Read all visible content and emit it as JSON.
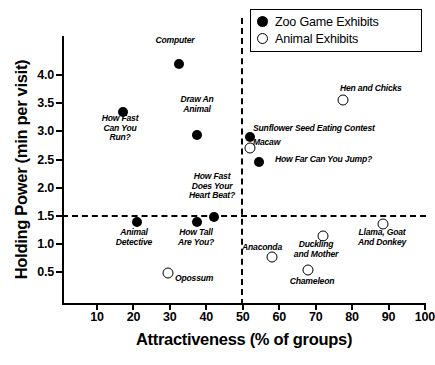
{
  "chart_data": {
    "type": "scatter",
    "title": "",
    "xlabel": "Attractiveness (% of groups)",
    "ylabel": "Holding Power (min per visit)",
    "xlim": [
      5,
      100
    ],
    "ylim": [
      0.2,
      4.35
    ],
    "xticks": [
      10,
      20,
      30,
      40,
      50,
      60,
      70,
      80,
      90,
      100
    ],
    "yticks": [
      "0.5",
      "1.0",
      "1.5",
      "2.0",
      "2.5",
      "3.0",
      "3.5",
      "4.0"
    ],
    "grid": false,
    "legend_position": "top-right",
    "reference_lines": [
      {
        "axis": "y",
        "value": 1.5,
        "style": "dashed"
      },
      {
        "axis": "x",
        "value": 50,
        "style": "dashed"
      }
    ],
    "series": [
      {
        "name": "Zoo Game Exhibits",
        "marker": "filled-circle",
        "color": "#000000",
        "points": [
          {
            "label": "Computer",
            "x": 32.5,
            "y": 4.2,
            "label_pos": "above",
            "lx": 175,
            "ly": 36,
            "align": "c"
          },
          {
            "label": "How Fast\nCan You\nRun?",
            "x": 17.0,
            "y": 3.35,
            "label_pos": "below",
            "lx": 120,
            "ly": 114,
            "align": "c"
          },
          {
            "label": "Draw An\nAnimal",
            "x": 37.5,
            "y": 2.93,
            "label_pos": "above",
            "lx": 197,
            "ly": 95,
            "align": "c"
          },
          {
            "label": "Sunflower Seed Eating Contest",
            "x": 52.0,
            "y": 2.9,
            "label_pos": "right",
            "lx": 253,
            "ly": 124,
            "align": "l"
          },
          {
            "label": "How Far Can You Jump?",
            "x": 54.5,
            "y": 2.46,
            "label_pos": "right",
            "lx": 275,
            "ly": 155,
            "align": "l"
          },
          {
            "label": "How Fast\nDoes Your\nHeart Beat?",
            "x": 42.0,
            "y": 1.48,
            "label_pos": "above",
            "lx": 212,
            "ly": 172,
            "align": "c"
          },
          {
            "label": "Animal\nDetective",
            "x": 21.0,
            "y": 1.39,
            "label_pos": "below",
            "lx": 134,
            "ly": 228,
            "align": "c"
          },
          {
            "label": "How Tall\nAre You?",
            "x": 37.5,
            "y": 1.4,
            "label_pos": "below",
            "lx": 196,
            "ly": 228,
            "align": "c"
          }
        ]
      },
      {
        "name": "Animal Exhibits",
        "marker": "open-circle",
        "color": "#000000",
        "points": [
          {
            "label": "Hen and Chicks",
            "x": 77.5,
            "y": 3.55,
            "label_pos": "right",
            "lx": 340,
            "ly": 84,
            "align": "l"
          },
          {
            "label": "Macaw",
            "x": 52.0,
            "y": 2.7,
            "label_pos": "right",
            "lx": 253,
            "ly": 138,
            "align": "l"
          },
          {
            "label": "Llama, Goat\nAnd Donkey",
            "x": 88.5,
            "y": 1.35,
            "label_pos": "below",
            "lx": 382,
            "ly": 228,
            "align": "c"
          },
          {
            "label": "Duckling\nand Mother",
            "x": 72.0,
            "y": 1.15,
            "label_pos": "below",
            "lx": 316,
            "ly": 240,
            "align": "c"
          },
          {
            "label": "Anaconda",
            "x": 58.0,
            "y": 0.78,
            "label_pos": "above",
            "lx": 262,
            "ly": 243,
            "align": "c"
          },
          {
            "label": "Chameleon",
            "x": 68.0,
            "y": 0.55,
            "label_pos": "below",
            "lx": 312,
            "ly": 277,
            "align": "c"
          },
          {
            "label": "Opossum",
            "x": 29.5,
            "y": 0.49,
            "label_pos": "right",
            "lx": 175,
            "ly": 274,
            "align": "l"
          }
        ]
      }
    ]
  },
  "legend": {
    "entries": [
      {
        "label": "Zoo Game Exhibits",
        "marker": "filled-circle"
      },
      {
        "label": "Animal Exhibits",
        "marker": "open-circle"
      }
    ]
  }
}
